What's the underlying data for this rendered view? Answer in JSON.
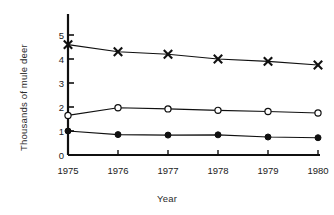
{
  "chart_data": {
    "type": "line",
    "title": "",
    "subtitle": "",
    "xlabel": "Year",
    "ylabel": "Thousands of mule deer",
    "x": [
      1975,
      1976,
      1977,
      1978,
      1979,
      1980
    ],
    "categories": [
      "1975",
      "1976",
      "1977",
      "1978",
      "1979",
      "1980"
    ],
    "xlim": [
      1975,
      1980
    ],
    "ylim": [
      0,
      5.5
    ],
    "yticks": [
      0,
      1,
      2,
      3,
      4,
      5
    ],
    "ytick_labels": [
      "0",
      "1",
      "2",
      "3",
      "4",
      "5"
    ],
    "xticks": [
      1975,
      1976,
      1977,
      1978,
      1979,
      1980
    ],
    "grid": false,
    "legend": "none",
    "series": [
      {
        "name": "series-x-marker",
        "marker": "x",
        "color": "#101010",
        "values": [
          4.6,
          4.3,
          4.2,
          4.0,
          3.9,
          3.75
        ]
      },
      {
        "name": "series-open-circle",
        "marker": "open-circle",
        "color": "#101010",
        "values": [
          1.65,
          1.97,
          1.92,
          1.86,
          1.81,
          1.75
        ]
      },
      {
        "name": "series-filled-circle",
        "marker": "filled-circle",
        "color": "#101010",
        "values": [
          1.0,
          0.85,
          0.83,
          0.84,
          0.75,
          0.72
        ]
      }
    ]
  },
  "axes": {
    "y_title": "Thousands of mule deer",
    "x_title": "Year",
    "ytick_0": "0",
    "ytick_1": "1",
    "ytick_2": "2",
    "ytick_3": "3",
    "ytick_4": "4",
    "ytick_5": "5",
    "xtick_1975": "1975",
    "xtick_1976": "1976",
    "xtick_1977": "1977",
    "xtick_1978": "1978",
    "xtick_1979": "1979",
    "xtick_1980": "1980"
  },
  "colors": {
    "ink": "#101010",
    "background": "#ffffff",
    "label": "#2b2b2b"
  }
}
